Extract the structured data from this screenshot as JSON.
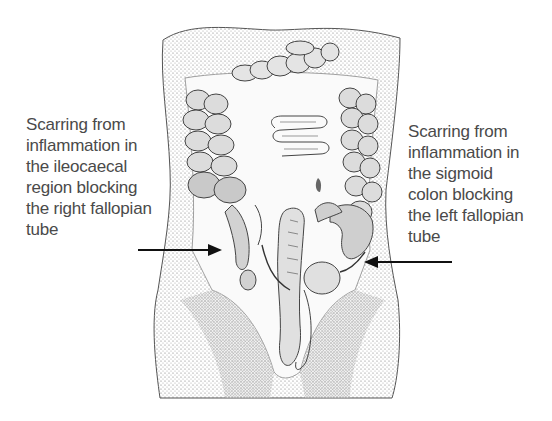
{
  "figure": {
    "annotations": [
      {
        "id": "left-annotation",
        "side": "left",
        "lines": [
          "Scarring from",
          "inflammation in",
          "the ileocaecal",
          "region blocking",
          "the right fallopian",
          "tube"
        ],
        "arrow_direction": "right"
      },
      {
        "id": "right-annotation",
        "side": "right",
        "lines": [
          "Scarring from",
          "inflammation in",
          "the sigmoid",
          "colon blocking",
          "the left fallopian",
          "tube"
        ],
        "arrow_direction": "left"
      }
    ],
    "colors": {
      "text": "#4a4a4a",
      "arrow": "#111111",
      "ink": "#333333",
      "shade": "#9a9a9a",
      "background": "#ffffff"
    }
  }
}
